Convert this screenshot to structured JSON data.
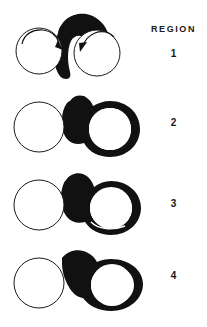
{
  "figure": {
    "background_color": "#ffffff",
    "ink_color": "#111111",
    "outline_color": "#1a1a1a",
    "fill_color": "#ffffff",
    "legend_heading": "REGION",
    "caption": ""
  },
  "legend": {
    "heading": "REGION",
    "entries": [
      {
        "label": "1"
      },
      {
        "label": "2"
      },
      {
        "label": "3"
      },
      {
        "label": "4"
      }
    ]
  },
  "panels": [
    {
      "id": "region-1",
      "label": "1",
      "description": "Two open circles side by side, nearly touching, joined at the top by a solid black lobed mass; two short arrows curve inward and downward into the gap between the circles.",
      "left_circle": {
        "cx": 39,
        "cy": 51,
        "r": 23
      },
      "right_circle": {
        "cx": 97,
        "cy": 53,
        "r": 23
      },
      "black_mass": "top-bridge-lobe",
      "arrows": [
        {
          "name": "left-inward-arrow",
          "direction": "down-right"
        },
        {
          "name": "right-inward-arrow",
          "direction": "down-left"
        }
      ],
      "has_arrows": true,
      "right_ring_filled": false
    },
    {
      "id": "region-2",
      "label": "2",
      "description": "Left circle remains a thin outline; right circle is surrounded by a thick black annulus, and a black band links the two circles with a small bump at the top.",
      "left_circle": {
        "cx": 39,
        "cy": 127,
        "r": 25
      },
      "right_circle": {
        "cx": 99,
        "cy": 128,
        "r": 24
      },
      "black_mass": "thick-ring-plus-bridge",
      "arrows": [],
      "has_arrows": false,
      "right_ring_filled": true
    },
    {
      "id": "region-3",
      "label": "3",
      "description": "Same as region 2 with a heavier black bridge; a thin white sliver separates the right ring from the band at the lower edge.",
      "left_circle": {
        "cx": 39,
        "cy": 205,
        "r": 25
      },
      "right_circle": {
        "cx": 99,
        "cy": 205,
        "r": 24
      },
      "black_mass": "thick-ring-plus-heavy-bridge",
      "arrows": [],
      "has_arrows": false,
      "right_ring_filled": true
    },
    {
      "id": "region-4",
      "label": "4",
      "description": "Left circle thin outline; right circle enclosed by a broad black ring that merges into a wide solid black bridge with a rounded shoulder at the top.",
      "left_circle": {
        "cx": 39,
        "cy": 283,
        "r": 25
      },
      "right_circle": {
        "cx": 101,
        "cy": 283,
        "r": 25
      },
      "black_mass": "broad-ring-plus-wide-bridge",
      "arrows": [],
      "has_arrows": false,
      "right_ring_filled": true
    }
  ]
}
